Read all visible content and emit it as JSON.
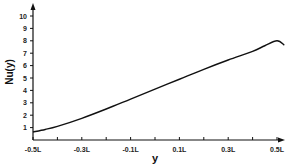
{
  "chart_data": {
    "type": "line",
    "title": "",
    "xlabel": "y",
    "ylabel": "Nu(y)",
    "x_tick_labels": [
      "-0.5L",
      "-0.3L",
      "-0.1L",
      "0.1L",
      "0.3L",
      "0.5L"
    ],
    "y_tick_labels": [
      "1",
      "2",
      "3",
      "4",
      "5",
      "6",
      "7",
      "8",
      "9",
      "10"
    ],
    "xlim": [
      -0.5,
      0.55
    ],
    "ylim": [
      0,
      10.5
    ],
    "grid": false,
    "legend": null,
    "series": [
      {
        "name": "Nu(y)",
        "x": [
          -0.5,
          -0.45,
          -0.4,
          -0.3,
          -0.2,
          -0.1,
          0.0,
          0.1,
          0.2,
          0.3,
          0.4,
          0.45,
          0.5,
          0.53
        ],
        "y": [
          0.65,
          0.85,
          1.1,
          1.75,
          2.5,
          3.3,
          4.1,
          4.9,
          5.7,
          6.45,
          7.15,
          7.6,
          8.0,
          7.65
        ]
      }
    ]
  }
}
